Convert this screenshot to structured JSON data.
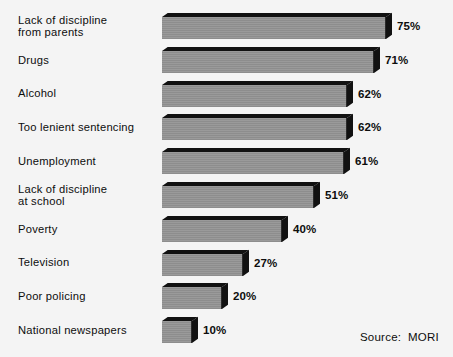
{
  "chart_data": {
    "type": "bar",
    "orientation": "horizontal",
    "title": "",
    "subtitle": "",
    "xlabel": "",
    "ylabel": "",
    "xlim": [
      0,
      80
    ],
    "grid": false,
    "legend": null,
    "value_suffix": "%",
    "categories": [
      "Lack of discipline from parents",
      "Drugs",
      "Alcohol",
      "Too lenient sentencing",
      "Unemployment",
      "Lack of discipline at school",
      "Poverty",
      "Television",
      "Poor policing",
      "National newspapers"
    ],
    "values": [
      75,
      71,
      62,
      62,
      61,
      51,
      40,
      27,
      20,
      10
    ],
    "value_labels": [
      "75%",
      "71%",
      "62%",
      "62%",
      "61%",
      "51%",
      "40%",
      "27%",
      "20%",
      "10%"
    ],
    "annotations": [
      "Source:  MORI"
    ],
    "colors": {
      "background": "#f4f4f4",
      "bar_front": "#919191",
      "bar_shadow": "#111111",
      "text": "#0d0d0d"
    }
  },
  "bars": [
    {
      "label_lines": [
        "Lack of discipline",
        "from parents"
      ],
      "value": 75,
      "value_label": "75%"
    },
    {
      "label_lines": [
        "Drugs"
      ],
      "value": 71,
      "value_label": "71%"
    },
    {
      "label_lines": [
        "Alcohol"
      ],
      "value": 62,
      "value_label": "62%"
    },
    {
      "label_lines": [
        "Too lenient sentencing"
      ],
      "value": 62,
      "value_label": "62%"
    },
    {
      "label_lines": [
        "Unemployment"
      ],
      "value": 61,
      "value_label": "61%"
    },
    {
      "label_lines": [
        "Lack of discipline",
        "at school"
      ],
      "value": 51,
      "value_label": "51%"
    },
    {
      "label_lines": [
        "Poverty"
      ],
      "value": 40,
      "value_label": "40%"
    },
    {
      "label_lines": [
        "Television"
      ],
      "value": 27,
      "value_label": "27%"
    },
    {
      "label_lines": [
        "Poor policing"
      ],
      "value": 20,
      "value_label": "20%"
    },
    {
      "label_lines": [
        "National newspapers"
      ],
      "value": 10,
      "value_label": "10%"
    }
  ],
  "footer": {
    "source_text": "Source:  MORI"
  }
}
